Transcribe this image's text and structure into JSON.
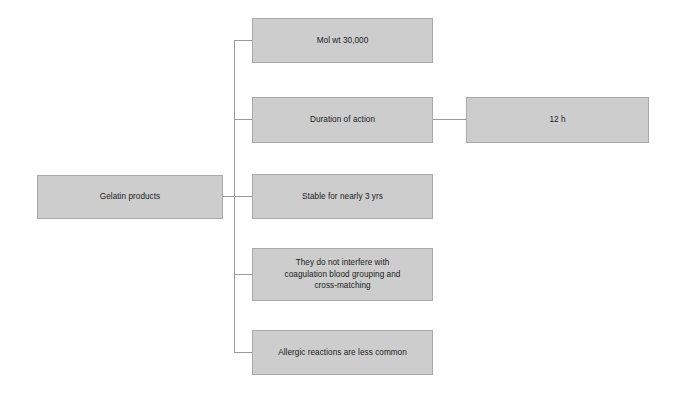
{
  "diagram": {
    "title": "Gelatin products",
    "type": "horizontal-tree",
    "canvas": {
      "width": 681,
      "height": 395,
      "background": "#ffffff"
    },
    "style": {
      "node_fill": "#cdcdcd",
      "node_border": "#a9a9a9",
      "connector_color": "#9a9a9a",
      "text_color": "#1a1a1a"
    },
    "root": {
      "id": "root",
      "label": "Gelatin products"
    },
    "branches": [
      {
        "id": "mol-wt",
        "label": "Mol wt 30,000"
      },
      {
        "id": "duration",
        "label": "Duration of action",
        "child": {
          "id": "duration-value",
          "label": "12 h"
        }
      },
      {
        "id": "stable",
        "label": "Stable for nearly 3 yrs"
      },
      {
        "id": "no-interfere",
        "label": "They do not interfere with\ncoagulation blood grouping and\ncross-matching"
      },
      {
        "id": "allergic",
        "label": "Allergic reactions are less common"
      }
    ]
  }
}
